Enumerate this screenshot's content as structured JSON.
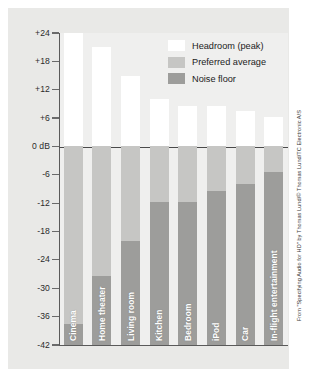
{
  "chart_data": {
    "type": "bar",
    "title": "",
    "subtitle": "",
    "xlabel": "",
    "ylabel": "",
    "yunit": "dB",
    "ylim": [
      -42,
      24
    ],
    "yticks": [
      24,
      18,
      12,
      6,
      0,
      -6,
      -12,
      -18,
      -24,
      -30,
      -36,
      -42
    ],
    "ytick_labels": [
      "+24",
      "+18",
      "+12",
      "+6",
      "0 dB",
      "-6",
      "-12",
      "-18",
      "-24",
      "-30",
      "-36",
      "-42"
    ],
    "grid": false,
    "stacked": true,
    "legend_position": "upper-right",
    "categories": [
      "Cinema",
      "Home theater",
      "Living room",
      "Kitchen",
      "Bedroom",
      "iPod",
      "Car",
      "In-flight entertainment"
    ],
    "series": [
      {
        "name": "Headroom (peak)",
        "color": "#ffffff",
        "values": [
          24,
          21,
          15,
          10,
          8.5,
          8.5,
          7.5,
          6.3
        ]
      },
      {
        "name": "Preferred average",
        "color": "#c6c6c4",
        "values": [
          0,
          0,
          0,
          0,
          0,
          0,
          0,
          0
        ]
      },
      {
        "name": "Noise floor",
        "color": "#9d9d9b",
        "values": [
          -37.5,
          -27.5,
          -20,
          -11.8,
          -11.8,
          -9.5,
          -8,
          -5.5
        ]
      }
    ],
    "bar_detail": [
      {
        "category": "Cinema",
        "peak": 24,
        "noise_floor": -37.5
      },
      {
        "category": "Home theater",
        "peak": 21,
        "noise_floor": -27.5
      },
      {
        "category": "Living room",
        "peak": 15,
        "noise_floor": -20
      },
      {
        "category": "Kitchen",
        "peak": 10,
        "noise_floor": -11.8
      },
      {
        "category": "Bedroom",
        "peak": 8.5,
        "noise_floor": -11.8
      },
      {
        "category": "iPod",
        "peak": 8.5,
        "noise_floor": -9.5
      },
      {
        "category": "Car",
        "peak": 7.5,
        "noise_floor": -8
      },
      {
        "category": "In-flight entertainment",
        "peak": 6.3,
        "noise_floor": -5.5
      }
    ]
  },
  "legend": {
    "items": [
      {
        "label": "Headroom (peak)",
        "swatch": "white"
      },
      {
        "label": "Preferred average",
        "swatch": "light-gray"
      },
      {
        "label": "Noise floor",
        "swatch": "dark-gray"
      }
    ]
  },
  "credit": {
    "text": "From \"Specifying Audio for HD\" by Thomas Lund/© Thomas Lund/TC Electronic A/S"
  },
  "colors": {
    "headroom": "#ffffff",
    "preferred_average": "#c6c6c4",
    "noise_floor": "#9d9d9b",
    "panel_background": "#e9e9e7",
    "plot_background": "#efefee",
    "axis": "#5a5a5a",
    "text": "#1c1c1c"
  }
}
